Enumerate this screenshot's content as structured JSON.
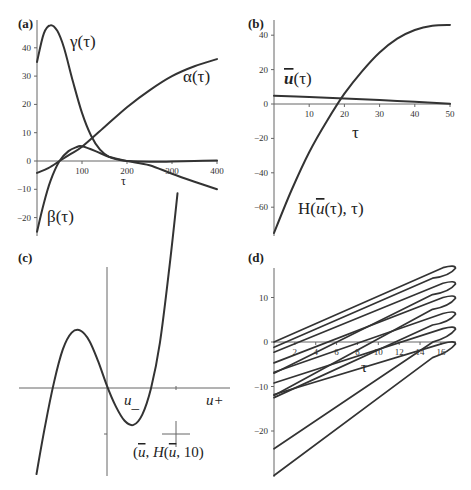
{
  "figure": {
    "panels": [
      "(a)",
      "(b)",
      "(c)",
      "(d)"
    ]
  },
  "chart_data": [
    {
      "id": "a",
      "type": "line",
      "panel_label": "(a)",
      "xlabel": "τ",
      "ylabel": "",
      "xlim": [
        0,
        400
      ],
      "ylim": [
        -25,
        48
      ],
      "x_ticks": [
        100,
        200,
        300,
        400
      ],
      "y_ticks": [
        -20,
        -10,
        0,
        10,
        20,
        30,
        40
      ],
      "grid": false,
      "series": [
        {
          "name": "γ(τ)",
          "x": [
            0,
            15,
            30,
            45,
            60,
            80,
            100,
            120,
            140,
            160,
            180,
            200,
            250,
            300,
            350,
            400
          ],
          "y": [
            35,
            45,
            48,
            46,
            40,
            28,
            17,
            9,
            4,
            1.5,
            0.5,
            0,
            -0.3,
            -0.2,
            0,
            0.2
          ]
        },
        {
          "name": "α(τ)",
          "x": [
            0,
            25,
            50,
            75,
            100,
            150,
            200,
            250,
            300,
            350,
            400
          ],
          "y": [
            -4.2,
            -2.5,
            0,
            2.5,
            5,
            12,
            19,
            25,
            30,
            33.5,
            36
          ]
        },
        {
          "name": "β(τ)",
          "x": [
            0,
            15,
            30,
            50,
            70,
            90,
            100,
            130,
            160,
            200,
            250,
            300,
            350,
            400
          ],
          "y": [
            -25,
            -15,
            -7,
            0,
            3.5,
            5,
            5.2,
            3.5,
            1.5,
            0,
            -1.5,
            -4.5,
            -7.3,
            -10
          ]
        }
      ],
      "annotations": [
        "γ(τ)",
        "α(τ)",
        "β(τ)"
      ]
    },
    {
      "id": "b",
      "type": "line",
      "panel_label": "(b)",
      "xlabel": "τ",
      "ylabel": "",
      "xlim": [
        0,
        50
      ],
      "ylim": [
        -75,
        46
      ],
      "x_ticks": [
        10,
        20,
        30,
        40,
        50
      ],
      "y_ticks": [
        -60,
        -40,
        -20,
        0,
        20,
        40
      ],
      "grid": false,
      "series": [
        {
          "name": "ū(τ)",
          "x": [
            0,
            10,
            20,
            30,
            40,
            50
          ],
          "y": [
            4.8,
            4,
            3.2,
            2.3,
            1.3,
            0.2
          ]
        },
        {
          "name": "H(ū(τ), τ)",
          "x": [
            0,
            5,
            10,
            15,
            20,
            25,
            30,
            35,
            40,
            45,
            50
          ],
          "y": [
            -75,
            -50,
            -28,
            -10,
            6,
            19,
            30,
            38,
            43,
            45.5,
            46
          ]
        }
      ],
      "annotations": [
        "ū(τ)",
        "H(ū(τ), τ)"
      ]
    },
    {
      "id": "c",
      "type": "line",
      "panel_label": "(c)",
      "xlabel": "",
      "ylabel": "",
      "grid": false,
      "description": "Cubic-shaped curve H(u,10) with roots; local minimum marked",
      "series": [
        {
          "name": "H(u, 10)",
          "shape": "cubic",
          "x": [
            -3.2,
            -2.8,
            -2.4,
            -2.0,
            -1.6,
            -1.2,
            -0.8,
            -0.4,
            0,
            0.4,
            0.8,
            1.2,
            1.6,
            2.0,
            2.4,
            2.8,
            3.2
          ],
          "y": [
            -4.2,
            -1.8,
            0.3,
            1.9,
            2.7,
            2.8,
            2.3,
            1.3,
            0.1,
            -0.9,
            -1.6,
            -1.8,
            -1.3,
            0,
            2.2,
            5.6,
            9.5
          ]
        }
      ],
      "annotations": [
        "u_",
        "u+",
        "(ū, H(ū, 10)"
      ]
    },
    {
      "id": "d",
      "type": "line",
      "panel_label": "(d)",
      "xlabel": "τ",
      "ylabel": "",
      "xlim": [
        0,
        17.4
      ],
      "ylim": [
        -30,
        17
      ],
      "x_ticks": [
        2,
        4,
        6,
        8,
        10,
        12,
        14,
        16
      ],
      "y_ticks": [
        -20,
        -10,
        0,
        10
      ],
      "grid": false,
      "description": "Family of nested loop curves, each pair of lines joining at the right at τ≈17.4",
      "series": [
        {
          "name": "loop-1",
          "tip_y": 17,
          "upper_start": 0,
          "lower_start": -1.2
        },
        {
          "name": "loop-2",
          "tip_y": 13.5,
          "upper_start": -2.3,
          "lower_start": -7
        },
        {
          "name": "loop-3",
          "tip_y": 10.3,
          "upper_start": -4.7,
          "lower_start": -12
        },
        {
          "name": "loop-4",
          "tip_y": 6.7,
          "upper_start": -6.8,
          "lower_start": -12.5
        },
        {
          "name": "loop-5",
          "tip_y": 3.3,
          "upper_start": -9.2,
          "lower_start": -24
        },
        {
          "name": "loop-6",
          "tip_y": 0,
          "upper_start": -11.8,
          "lower_start": -30
        }
      ],
      "extra_lines": [
        {
          "name": "line-a",
          "start_y": -18.3,
          "end_x": 17.4,
          "end_y": 3.0
        }
      ]
    }
  ]
}
